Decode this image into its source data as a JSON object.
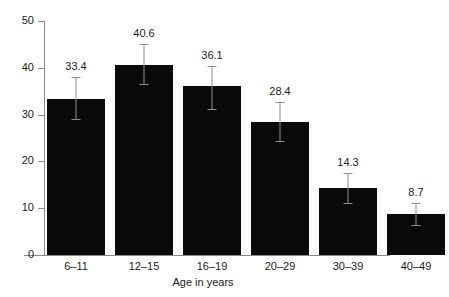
{
  "chart_data": {
    "type": "bar",
    "title": "",
    "xlabel": "Age in years",
    "ylabel": "",
    "categories": [
      "6–11",
      "12–15",
      "16–19",
      "20–29",
      "30–39",
      "40–49"
    ],
    "values": [
      33.4,
      40.6,
      36.1,
      28.4,
      14.3,
      8.7
    ],
    "value_labels": [
      "33.4",
      "40.6",
      "36.1",
      "28.4",
      "14.3",
      "8.7"
    ],
    "error_bars": {
      "type": "confidence-interval",
      "lower": [
        29.0,
        36.5,
        31.3,
        24.4,
        11.1,
        6.4
      ],
      "upper": [
        38.0,
        45.0,
        40.4,
        32.6,
        17.6,
        11.2
      ]
    },
    "ylim": [
      0,
      50
    ],
    "yticks": [
      0,
      10,
      20,
      30,
      40,
      50
    ],
    "ytick_labels": [
      "0",
      "10",
      "20",
      "30",
      "40",
      "50"
    ],
    "grid": false,
    "legend": null,
    "bar_color": "#0a0a0a",
    "errorbar_color": "#8f8f8f",
    "axis_color": "#8a8a8a",
    "background_color": "#ffffff"
  }
}
